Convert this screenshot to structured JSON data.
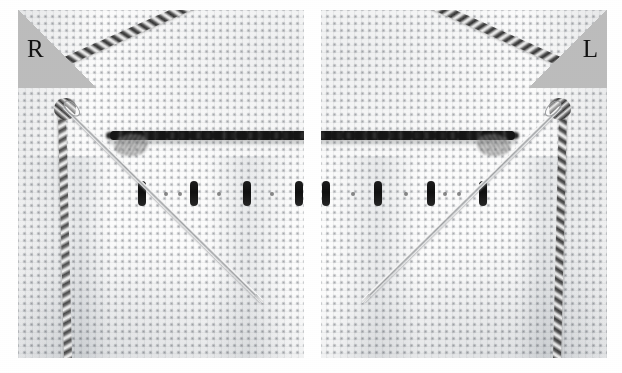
{
  "figure": {
    "kind": "photograph",
    "panel_count": 2,
    "background_color": "#ffffff",
    "cloth_color": "#fcfcfc",
    "thread_color": "#1a1a1a",
    "needle_color": "#c9cbcd",
    "badge_color": "#bcbcbc",
    "badge_text_color": "#111111"
  },
  "panels": [
    {
      "id": "panel-right",
      "badge_label": "R",
      "badge_position": "top-left",
      "name": "right-hand version"
    },
    {
      "id": "panel-left",
      "badge_label": "L",
      "badge_position": "top-right",
      "name": "left-hand mirrored version"
    }
  ],
  "elements": {
    "backstitch_label": "horizontal backstitch row",
    "dashes_label": "vertical stitch marks",
    "thread_label": "twisted working thread",
    "needle_label": "embroidery needle",
    "cloth_label": "aida cloth weave"
  }
}
